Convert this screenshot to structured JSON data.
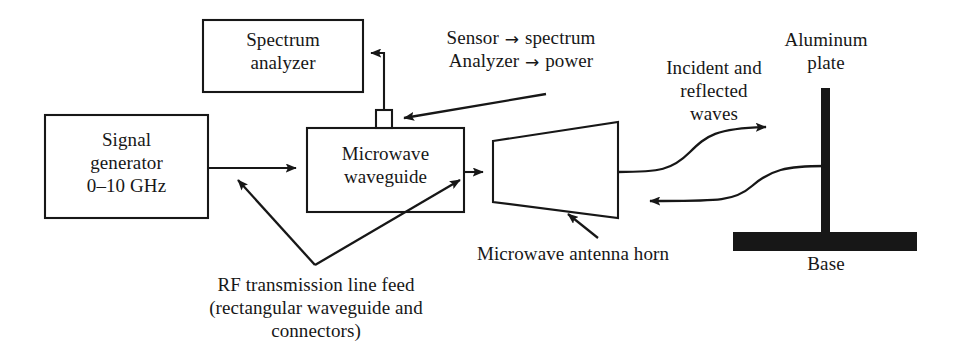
{
  "figure": {
    "type": "block-diagram",
    "background_color": "#ffffff",
    "line_color": "#1a1a1a",
    "fill_color": "#000000"
  },
  "blocks": {
    "spectrum_analyzer": {
      "label_line1": "Spectrum",
      "label_line2": "analyzer"
    },
    "signal_generator": {
      "label_line1": "Signal",
      "label_line2": "generator",
      "label_line3": "0–10 GHz"
    },
    "microwave_waveguide": {
      "label_line1": "Microwave",
      "label_line2": "waveguide"
    }
  },
  "annotations": {
    "sensor_note": {
      "line1_prefix": "Sensor",
      "line1_arrow": "→",
      "line1_suffix": "spectrum",
      "line2_prefix": "Analyzer",
      "line2_arrow": "→",
      "line2_suffix": "power"
    },
    "incident_reflected": {
      "line1": "Incident and",
      "line2": "reflected",
      "line3": "waves"
    },
    "aluminum_plate": {
      "line1": "Aluminum",
      "line2": "plate"
    },
    "rf_feed": {
      "line1": "RF transmission line feed",
      "line2": "(rectangular waveguide and",
      "line3": "connectors)"
    },
    "antenna_horn": {
      "line1": "Microwave antenna horn"
    },
    "base": {
      "line1": "Base"
    }
  }
}
